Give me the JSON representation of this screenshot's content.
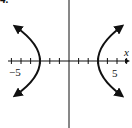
{
  "chart_data": {
    "type": "line",
    "title": "",
    "problem_label": "4.",
    "xlabel": "x",
    "ylabel": "y",
    "tick_labels": {
      "left": "−5",
      "right": "5"
    },
    "xlim": [
      -6.5,
      6.5
    ],
    "ylim": [
      -6.5,
      6.5
    ],
    "grid": false,
    "legend": "none",
    "series": [
      {
        "name": "left-branch",
        "points": [
          [
            -5,
            3.6
          ],
          [
            -4,
            2.2
          ],
          [
            -3,
            0
          ],
          [
            -4,
            -2.2
          ],
          [
            -5,
            -3.6
          ]
        ]
      },
      {
        "name": "right-branch",
        "points": [
          [
            5,
            3.6
          ],
          [
            4,
            2.2
          ],
          [
            3,
            0
          ],
          [
            4,
            -2.2
          ],
          [
            5,
            -3.6
          ]
        ]
      }
    ],
    "vertices": [
      [
        -3,
        0
      ],
      [
        3,
        0
      ]
    ],
    "x_ticks": [
      -6,
      -5,
      -4,
      -3,
      -2,
      -1,
      1,
      2,
      3,
      4,
      5,
      6
    ]
  },
  "colors": {
    "ink": "#111111",
    "background": "#ffffff"
  }
}
